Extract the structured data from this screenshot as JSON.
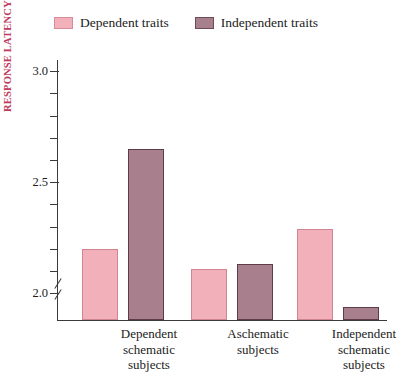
{
  "chart_data": {
    "type": "bar",
    "title": "",
    "xlabel": "",
    "ylabel": "RESPONSE LATENCY (SECONDS)",
    "categories": [
      "Dependent\nschematic\nsubjects",
      "Aschematic\nsubjects",
      "Independent\nschematic\nsubjects"
    ],
    "series": [
      {
        "name": "Dependent traits",
        "color": "#f2b0bb",
        "values": [
          2.2,
          2.11,
          2.29
        ]
      },
      {
        "name": "Independent traits",
        "color": "#a8808d",
        "values": [
          2.65,
          2.13,
          1.94
        ]
      }
    ],
    "ylim": [
      1.88,
      3.05
    ],
    "ytick_labels": [
      "2.0",
      "2.5",
      "3.0"
    ],
    "ytick_values": [
      2.0,
      2.5,
      3.0
    ],
    "yminor_values": [
      2.1,
      2.2,
      2.3,
      2.4,
      2.6,
      2.7,
      2.8,
      2.9
    ],
    "axis_break": true,
    "grid": false,
    "legend_position": "top-left",
    "axis_title_color": "#c0395a"
  },
  "legend": {
    "items": [
      {
        "label": "Dependent traits",
        "color": "#f2b0bb"
      },
      {
        "label": "Independent traits",
        "color": "#a8808d"
      }
    ]
  }
}
